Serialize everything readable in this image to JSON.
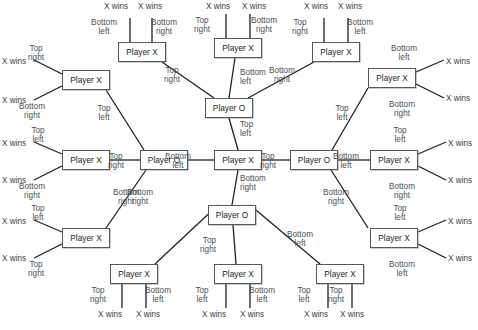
{
  "diagram": {
    "kind": "game-tree",
    "player_x": "Player X",
    "player_o": "Player O",
    "x_wins": "X wins",
    "moves": {
      "top_left": "Top\nleft",
      "top_right": "Top\nright",
      "bottom_left": "Bottom\nleft",
      "bottom_right": "Bottom\nright"
    },
    "colors": {
      "node_border": "#55585c",
      "node_fill": "#ffffff",
      "edge": "#231f20",
      "label_text": "#4d4f53",
      "background": "#ffffff"
    },
    "nodes": [
      {
        "id": "root",
        "label": "Player X",
        "x": 214,
        "y": 150,
        "w": 48,
        "h": 20
      },
      {
        "id": "o_n",
        "label": "Player O",
        "x": 205,
        "y": 98,
        "w": 48,
        "h": 20
      },
      {
        "id": "o_s",
        "label": "Player O",
        "x": 208,
        "y": 205,
        "w": 48,
        "h": 20
      },
      {
        "id": "o_w",
        "label": "Player O",
        "x": 140,
        "y": 150,
        "w": 48,
        "h": 20
      },
      {
        "id": "o_e",
        "label": "Player O",
        "x": 290,
        "y": 150,
        "w": 48,
        "h": 20
      },
      {
        "id": "x_t1",
        "label": "Player X",
        "x": 118,
        "y": 42,
        "w": 48,
        "h": 20
      },
      {
        "id": "x_t2",
        "label": "Player X",
        "x": 214,
        "y": 38,
        "w": 48,
        "h": 20
      },
      {
        "id": "x_t3",
        "label": "Player X",
        "x": 312,
        "y": 42,
        "w": 48,
        "h": 20
      },
      {
        "id": "x_b1",
        "label": "Player X",
        "x": 110,
        "y": 264,
        "w": 48,
        "h": 20
      },
      {
        "id": "x_b2",
        "label": "Player X",
        "x": 214,
        "y": 264,
        "w": 48,
        "h": 20
      },
      {
        "id": "x_b3",
        "label": "Player X",
        "x": 316,
        "y": 264,
        "w": 48,
        "h": 20
      },
      {
        "id": "x_l1",
        "label": "Player X",
        "x": 62,
        "y": 70,
        "w": 48,
        "h": 20
      },
      {
        "id": "x_l2",
        "label": "Player X",
        "x": 62,
        "y": 150,
        "w": 48,
        "h": 20
      },
      {
        "id": "x_l3",
        "label": "Player X",
        "x": 62,
        "y": 228,
        "w": 48,
        "h": 20
      },
      {
        "id": "x_r1",
        "label": "Player X",
        "x": 368,
        "y": 68,
        "w": 48,
        "h": 20
      },
      {
        "id": "x_r2",
        "label": "Player X",
        "x": 370,
        "y": 150,
        "w": 48,
        "h": 20
      },
      {
        "id": "x_r3",
        "label": "Player X",
        "x": 370,
        "y": 228,
        "w": 48,
        "h": 20
      }
    ],
    "edges": [
      {
        "from": "root",
        "to": "o_n",
        "move": "top_left",
        "x1": 238,
        "y1": 150,
        "x2": 229,
        "y2": 118
      },
      {
        "from": "root",
        "to": "o_s",
        "move": "bottom_right",
        "x1": 238,
        "y1": 170,
        "x2": 232,
        "y2": 205
      },
      {
        "from": "root",
        "to": "o_w",
        "move": "bottom_left",
        "x1": 214,
        "y1": 160,
        "x2": 188,
        "y2": 160
      },
      {
        "from": "root",
        "to": "o_e",
        "move": "top_right",
        "x1": 262,
        "y1": 160,
        "x2": 290,
        "y2": 160
      },
      {
        "from": "o_n",
        "to": "x_t1",
        "move": "top_right",
        "x1": 214,
        "y1": 98,
        "x2": 162,
        "y2": 62
      },
      {
        "from": "o_n",
        "to": "x_t2",
        "move": "bottom_left",
        "x1": 229,
        "y1": 98,
        "x2": 235,
        "y2": 58
      },
      {
        "from": "o_n",
        "to": "x_t3",
        "move": "bottom_right",
        "x1": 248,
        "y1": 98,
        "x2": 314,
        "y2": 62
      },
      {
        "from": "o_s",
        "to": "x_b1",
        "move": "bottom_right",
        "x1": 218,
        "y1": 205,
        "x2": 155,
        "y2": 264
      },
      {
        "from": "o_s",
        "to": "x_b2",
        "move": "top_right",
        "x1": 233,
        "y1": 225,
        "x2": 236,
        "y2": 264
      },
      {
        "from": "o_s",
        "to": "x_b3",
        "move": "bottom_left",
        "x1": 250,
        "y1": 205,
        "x2": 320,
        "y2": 264
      },
      {
        "from": "o_w",
        "to": "x_l1",
        "move": "top_left",
        "x1": 144,
        "y1": 150,
        "x2": 106,
        "y2": 90
      },
      {
        "from": "o_w",
        "to": "x_l2",
        "move": "top_right",
        "x1": 140,
        "y1": 160,
        "x2": 110,
        "y2": 160
      },
      {
        "from": "o_w",
        "to": "x_l3",
        "move": "bottom_right",
        "x1": 146,
        "y1": 170,
        "x2": 106,
        "y2": 228
      },
      {
        "from": "o_e",
        "to": "x_r1",
        "move": "top_left",
        "x1": 332,
        "y1": 150,
        "x2": 368,
        "y2": 88
      },
      {
        "from": "o_e",
        "to": "x_r2",
        "move": "bottom_left",
        "x1": 338,
        "y1": 160,
        "x2": 370,
        "y2": 160
      },
      {
        "from": "o_e",
        "to": "x_r3",
        "move": "bottom_right",
        "x1": 331,
        "y1": 170,
        "x2": 368,
        "y2": 228
      }
    ],
    "leaf_edges": [
      {
        "parent": "x_t1",
        "move": "bottom_left",
        "x1": 130,
        "y1": 42,
        "x2": 130,
        "y2": 18
      },
      {
        "parent": "x_t1",
        "move": "bottom_right",
        "x1": 152,
        "y1": 42,
        "x2": 152,
        "y2": 18
      },
      {
        "parent": "x_t2",
        "move": "top_right",
        "x1": 226,
        "y1": 38,
        "x2": 226,
        "y2": 14
      },
      {
        "parent": "x_t2",
        "move": "bottom_right",
        "x1": 250,
        "y1": 38,
        "x2": 250,
        "y2": 14
      },
      {
        "parent": "x_t3",
        "move": "top_right",
        "x1": 324,
        "y1": 42,
        "x2": 324,
        "y2": 18
      },
      {
        "parent": "x_t3",
        "move": "bottom_left",
        "x1": 348,
        "y1": 42,
        "x2": 348,
        "y2": 18
      },
      {
        "parent": "x_b1",
        "move": "top_right",
        "x1": 122,
        "y1": 284,
        "x2": 122,
        "y2": 308
      },
      {
        "parent": "x_b1",
        "move": "bottom_left",
        "x1": 146,
        "y1": 284,
        "x2": 146,
        "y2": 308
      },
      {
        "parent": "x_b2",
        "move": "top_left",
        "x1": 226,
        "y1": 284,
        "x2": 226,
        "y2": 308
      },
      {
        "parent": "x_b2",
        "move": "bottom_left",
        "x1": 250,
        "y1": 284,
        "x2": 250,
        "y2": 308
      },
      {
        "parent": "x_b3",
        "move": "top_left",
        "x1": 328,
        "y1": 284,
        "x2": 328,
        "y2": 308
      },
      {
        "parent": "x_b3",
        "move": "top_right",
        "x1": 352,
        "y1": 284,
        "x2": 352,
        "y2": 308
      },
      {
        "parent": "x_l1",
        "move": "top_right",
        "x1": 62,
        "y1": 74,
        "x2": 34,
        "y2": 60
      },
      {
        "parent": "x_l1",
        "move": "bottom_right",
        "x1": 62,
        "y1": 86,
        "x2": 34,
        "y2": 100
      },
      {
        "parent": "x_l2",
        "move": "top_left",
        "x1": 62,
        "y1": 154,
        "x2": 34,
        "y2": 142
      },
      {
        "parent": "x_l2",
        "move": "bottom_right",
        "x1": 62,
        "y1": 166,
        "x2": 34,
        "y2": 180
      },
      {
        "parent": "x_l3",
        "move": "top_left",
        "x1": 62,
        "y1": 232,
        "x2": 34,
        "y2": 220
      },
      {
        "parent": "x_l3",
        "move": "top_right",
        "x1": 62,
        "y1": 244,
        "x2": 34,
        "y2": 258
      },
      {
        "parent": "x_r1",
        "move": "bottom_left",
        "x1": 416,
        "y1": 72,
        "x2": 444,
        "y2": 60
      },
      {
        "parent": "x_r1",
        "move": "bottom_right",
        "x1": 416,
        "y1": 84,
        "x2": 444,
        "y2": 98
      },
      {
        "parent": "x_r2",
        "move": "top_left",
        "x1": 418,
        "y1": 154,
        "x2": 446,
        "y2": 142
      },
      {
        "parent": "x_r2",
        "move": "bottom_right",
        "x1": 418,
        "y1": 166,
        "x2": 446,
        "y2": 180
      },
      {
        "parent": "x_r3",
        "move": "top_left",
        "x1": 418,
        "y1": 232,
        "x2": 446,
        "y2": 220
      },
      {
        "parent": "x_r3",
        "move": "bottom_left",
        "x1": 418,
        "y1": 244,
        "x2": 446,
        "y2": 258
      }
    ],
    "edge_labels": [
      {
        "id": "el-root-n",
        "text": "Top\nleft",
        "x": 240,
        "y": 120,
        "align": "left"
      },
      {
        "id": "el-root-s",
        "text": "Bottom\nright",
        "x": 240,
        "y": 174,
        "align": "left"
      },
      {
        "id": "el-root-w",
        "text": "Bottom\nleft",
        "x": 178,
        "y": 152,
        "align": "center"
      },
      {
        "id": "el-root-e",
        "text": "Top\nright",
        "x": 268,
        "y": 152,
        "align": "center"
      },
      {
        "id": "el-n-t1",
        "text": "Top\nright",
        "x": 172,
        "y": 66,
        "align": "center"
      },
      {
        "id": "el-n-t2",
        "text": "Bottom\nleft",
        "x": 240,
        "y": 68,
        "align": "left"
      },
      {
        "id": "el-n-t3",
        "text": "Bottom\nright",
        "x": 282,
        "y": 66,
        "align": "center"
      },
      {
        "id": "el-s-b1",
        "text": "Bottom\nright",
        "x": 140,
        "y": 188,
        "align": "center"
      },
      {
        "id": "el-s-b2",
        "text": "Top\nright",
        "x": 216,
        "y": 236,
        "align": "right"
      },
      {
        "id": "el-s-b3",
        "text": "Bottom\nleft",
        "x": 300,
        "y": 230,
        "align": "center"
      },
      {
        "id": "el-w-l1",
        "text": "Top\nleft",
        "x": 104,
        "y": 104,
        "align": "center"
      },
      {
        "id": "el-w-l2",
        "text": "Top\nright",
        "x": 116,
        "y": 152,
        "align": "center"
      },
      {
        "id": "el-w-l3",
        "text": "Bottom\nright",
        "x": 126,
        "y": 188,
        "align": "center"
      },
      {
        "id": "el-e-r1",
        "text": "Top\nleft",
        "x": 342,
        "y": 104,
        "align": "center"
      },
      {
        "id": "el-e-r2",
        "text": "Bottom\nleft",
        "x": 346,
        "y": 152,
        "align": "center"
      },
      {
        "id": "el-e-r3",
        "text": "Bottom\nright",
        "x": 336,
        "y": 188,
        "align": "center"
      }
    ],
    "leaf_labels": [
      {
        "id": "ll-t1-a",
        "move": "Bottom\nleft",
        "mx": 104,
        "my": 18,
        "wx": 104,
        "wy": 2,
        "align": "center"
      },
      {
        "id": "ll-t1-b",
        "move": "Bottom\nright",
        "mx": 164,
        "my": 18,
        "wx": 138,
        "wy": 2,
        "align": "center"
      },
      {
        "id": "ll-t2-a",
        "move": "Top\nright",
        "mx": 202,
        "my": 16,
        "wx": 206,
        "wy": 2,
        "align": "center"
      },
      {
        "id": "ll-t2-b",
        "move": "Bottom\nright",
        "mx": 264,
        "my": 16,
        "wx": 242,
        "wy": 2,
        "align": "center"
      },
      {
        "id": "ll-t3-a",
        "move": "Top\nright",
        "mx": 300,
        "my": 18,
        "wx": 304,
        "wy": 2,
        "align": "center"
      },
      {
        "id": "ll-t3-b",
        "move": "Bottom\nleft",
        "mx": 360,
        "my": 18,
        "wx": 338,
        "wy": 2,
        "align": "center"
      },
      {
        "id": "ll-b1-a",
        "move": "Top\nright",
        "mx": 98,
        "my": 286,
        "wx": 98,
        "wy": 310,
        "align": "center"
      },
      {
        "id": "ll-b1-b",
        "move": "Bottom\nleft",
        "mx": 158,
        "my": 286,
        "wx": 136,
        "wy": 310,
        "align": "center"
      },
      {
        "id": "ll-b2-a",
        "move": "Top\nleft",
        "mx": 202,
        "my": 286,
        "wx": 202,
        "wy": 310,
        "align": "center"
      },
      {
        "id": "ll-b2-b",
        "move": "Bottom\nleft",
        "mx": 262,
        "my": 286,
        "wx": 240,
        "wy": 310,
        "align": "center"
      },
      {
        "id": "ll-b3-a",
        "move": "Top\nleft",
        "mx": 304,
        "my": 286,
        "wx": 304,
        "wy": 310,
        "align": "center"
      },
      {
        "id": "ll-b3-b",
        "move": "Top\nright",
        "mx": 336,
        "my": 286,
        "wx": 340,
        "wy": 310,
        "align": "center"
      },
      {
        "id": "ll-l1-a",
        "move": "Top\nright",
        "mx": 36,
        "my": 44,
        "wx": 2,
        "wy": 57,
        "align": "center"
      },
      {
        "id": "ll-l1-b",
        "move": "Bottom\nright",
        "mx": 32,
        "my": 102,
        "wx": 2,
        "wy": 96,
        "align": "center"
      },
      {
        "id": "ll-l2-a",
        "move": "Top\nleft",
        "mx": 38,
        "my": 126,
        "wx": 2,
        "wy": 139,
        "align": "center"
      },
      {
        "id": "ll-l2-b",
        "move": "Bottom\nright",
        "mx": 32,
        "my": 182,
        "wx": 2,
        "wy": 176,
        "align": "center"
      },
      {
        "id": "ll-l3-a",
        "move": "Top\nleft",
        "mx": 38,
        "my": 204,
        "wx": 2,
        "wy": 217,
        "align": "center"
      },
      {
        "id": "ll-l3-b",
        "move": "Top\nright",
        "mx": 36,
        "my": 260,
        "wx": 2,
        "wy": 254,
        "align": "center"
      },
      {
        "id": "ll-r1-a",
        "move": "Bottom\nleft",
        "mx": 404,
        "my": 44,
        "wx": 446,
        "wy": 57,
        "align": "center"
      },
      {
        "id": "ll-r1-b",
        "move": "Bottom\nright",
        "mx": 402,
        "my": 100,
        "wx": 446,
        "wy": 94,
        "align": "center"
      },
      {
        "id": "ll-r2-a",
        "move": "Top\nleft",
        "mx": 400,
        "my": 126,
        "wx": 448,
        "wy": 139,
        "align": "center"
      },
      {
        "id": "ll-r2-b",
        "move": "Bottom\nright",
        "mx": 402,
        "my": 182,
        "wx": 448,
        "wy": 176,
        "align": "center"
      },
      {
        "id": "ll-r3-a",
        "move": "Top\nleft",
        "mx": 400,
        "my": 204,
        "wx": 448,
        "wy": 217,
        "align": "center"
      },
      {
        "id": "ll-r3-b",
        "move": "Bottom\nleft",
        "mx": 402,
        "my": 260,
        "wx": 448,
        "wy": 254,
        "align": "center"
      }
    ]
  }
}
